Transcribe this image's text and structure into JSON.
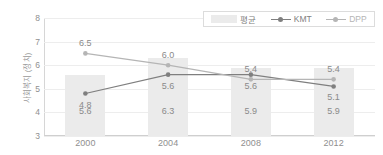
{
  "chart_data": {
    "type": "bar",
    "title": "",
    "subtitle": "",
    "xlabel": "",
    "ylabel": "사회복지 (정치)",
    "categories": [
      "2000",
      "2004",
      "2008",
      "2012"
    ],
    "ylim": [
      3,
      8
    ],
    "yticks": [
      "8",
      "7",
      "6",
      "5",
      "4",
      "3"
    ],
    "grid": true,
    "legend_position": "top-right",
    "series": [
      {
        "name": "평균",
        "type": "bar",
        "values": [
          5.6,
          6.3,
          5.9,
          5.9
        ],
        "labels": [
          "5.6",
          "6.3",
          "5.9",
          "5.9"
        ],
        "color": "#ebebeb"
      },
      {
        "name": "KMT",
        "type": "line",
        "values": [
          4.8,
          5.6,
          5.6,
          5.1
        ],
        "labels": [
          "4.8",
          "5.6",
          "5.6",
          "5.1"
        ],
        "color": "#7f7f7f"
      },
      {
        "name": "DPP",
        "type": "line",
        "values": [
          6.5,
          6.0,
          5.4,
          5.4
        ],
        "labels": [
          "6.5",
          "6.0",
          "5.4",
          "5.4"
        ],
        "color": "#b5b5b5"
      }
    ]
  },
  "legend": {
    "items": [
      {
        "label": "평균",
        "marker": "bar-swatch"
      },
      {
        "label": "KMT",
        "marker": "line-marker-icon"
      },
      {
        "label": "DPP",
        "marker": "line-marker-icon"
      }
    ]
  }
}
